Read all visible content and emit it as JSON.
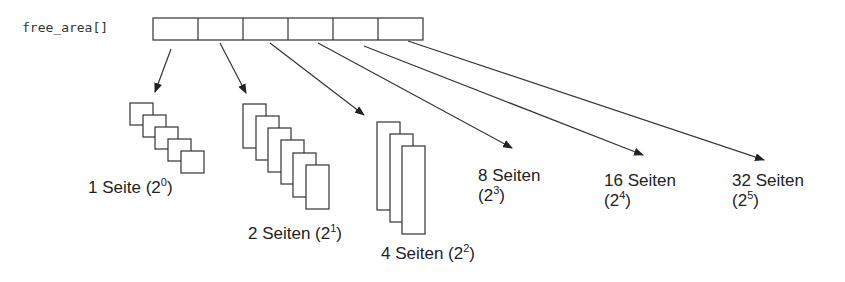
{
  "array_label": "free_area[]",
  "array_cells": 6,
  "colors": {
    "stroke": "#333333",
    "text": "#222222",
    "background": "#ffffff"
  },
  "groups": [
    {
      "count_text": "1 Seite (2",
      "exp": "0",
      "close": ")"
    },
    {
      "count_text": "2 Seiten (2",
      "exp": "1",
      "close": ")"
    },
    {
      "count_text": "4 Seiten (2",
      "exp": "2",
      "close": ")"
    },
    {
      "line1": "8 Seiten",
      "line2_open": "(2",
      "exp": "3",
      "close": ")"
    },
    {
      "line1": "16 Seiten",
      "line2_open": "(2",
      "exp": "4",
      "close": ")"
    },
    {
      "line1": "32 Seiten",
      "line2_open": "(2",
      "exp": "5",
      "close": ")"
    }
  ]
}
